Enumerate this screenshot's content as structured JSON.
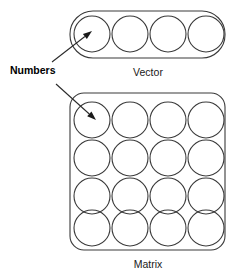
{
  "figure": {
    "background_color": "#ffffff",
    "stroke_color": "#3a3a3a",
    "text_color": "#1a1a1a",
    "width": 238,
    "height": 280
  },
  "callout": {
    "label": "Numbers",
    "x": 10,
    "y": 74,
    "arrows": [
      {
        "name": "arrow-to-vector",
        "from_x": 52,
        "from_y": 62,
        "to_x": 92,
        "to_y": 31
      },
      {
        "name": "arrow-to-matrix",
        "from_x": 56,
        "from_y": 84,
        "to_x": 96,
        "to_y": 120
      }
    ]
  },
  "vector": {
    "caption": "Vector",
    "caption_x": 148,
    "caption_y": 76,
    "box": {
      "x": 70,
      "y": 11,
      "width": 155,
      "height": 47,
      "radius": 23
    },
    "cell_count": 4,
    "cell_radius": 18,
    "cell_centers": [
      {
        "cx": 92,
        "cy": 34
      },
      {
        "cx": 130,
        "cy": 34
      },
      {
        "cx": 168,
        "cy": 34
      },
      {
        "cx": 206,
        "cy": 34
      }
    ]
  },
  "matrix": {
    "caption": "Matrix",
    "caption_x": 148,
    "caption_y": 268,
    "box": {
      "x": 70,
      "y": 93,
      "width": 155,
      "height": 157,
      "radius": 14
    },
    "rows": 4,
    "columns": 4,
    "cell_radius": 18,
    "cell_centers": [
      {
        "cx": 92,
        "cy": 120
      },
      {
        "cx": 130,
        "cy": 120
      },
      {
        "cx": 168,
        "cy": 120
      },
      {
        "cx": 206,
        "cy": 120
      },
      {
        "cx": 92,
        "cy": 158
      },
      {
        "cx": 130,
        "cy": 158
      },
      {
        "cx": 168,
        "cy": 158
      },
      {
        "cx": 206,
        "cy": 158
      },
      {
        "cx": 92,
        "cy": 196
      },
      {
        "cx": 130,
        "cy": 196
      },
      {
        "cx": 168,
        "cy": 196
      },
      {
        "cx": 206,
        "cy": 196
      },
      {
        "cx": 92,
        "cy": 228
      },
      {
        "cx": 130,
        "cy": 228
      },
      {
        "cx": 168,
        "cy": 228
      },
      {
        "cx": 206,
        "cy": 228
      }
    ]
  }
}
